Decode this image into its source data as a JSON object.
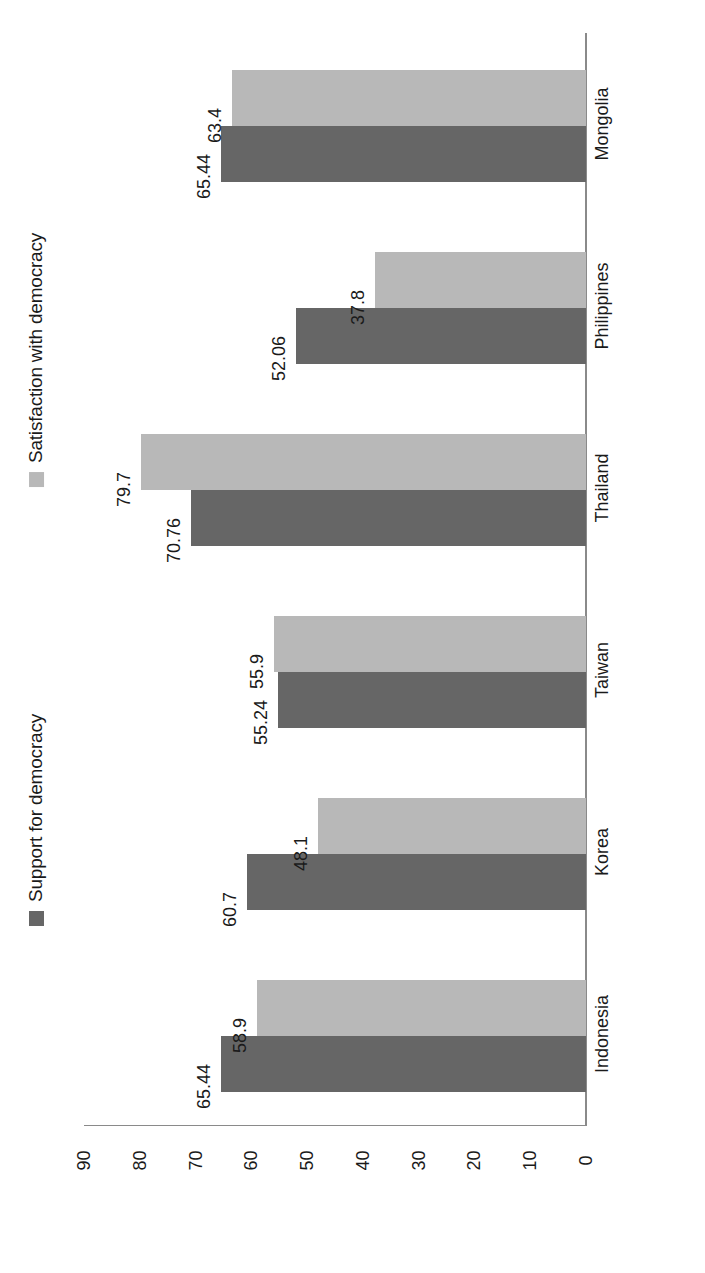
{
  "chart_data": {
    "type": "bar",
    "orientation": "horizontal-rotated",
    "title": "",
    "xlabel": "",
    "ylabel": "",
    "categories": [
      "Indonesia",
      "Korea",
      "Taiwan",
      "Thailand",
      "Philippines",
      "Mongolia"
    ],
    "series": [
      {
        "name": "Support for democracy",
        "color": "#666666",
        "values": [
          65.44,
          60.7,
          55.24,
          70.76,
          52.06,
          65.44
        ],
        "labels": [
          "65.44",
          "60.7",
          "55.24",
          "70.76",
          "52.06",
          "65.44"
        ]
      },
      {
        "name": "Satisfaction with democracy",
        "color": "#b8b8b8",
        "values": [
          58.9,
          48.1,
          55.9,
          79.7,
          37.8,
          63.4
        ],
        "labels": [
          "58.9",
          "48.1",
          "55.9",
          "79.7",
          "37.8",
          "63.4"
        ]
      }
    ],
    "value_axis": {
      "min": 0,
      "max": 90,
      "ticks": [
        90,
        80,
        70,
        60,
        50,
        40,
        30,
        20,
        10,
        0
      ],
      "tick_labels": [
        "90",
        "80",
        "70",
        "60",
        "50",
        "40",
        "30",
        "20",
        "10",
        "0"
      ],
      "direction": "descending-left-to-right",
      "grid": false
    },
    "legend": {
      "position": "left-rotated",
      "entries": [
        {
          "label": "Satisfaction with democracy",
          "color": "#b8b8b8"
        },
        {
          "label": "Support for democracy",
          "color": "#666666"
        }
      ]
    }
  }
}
